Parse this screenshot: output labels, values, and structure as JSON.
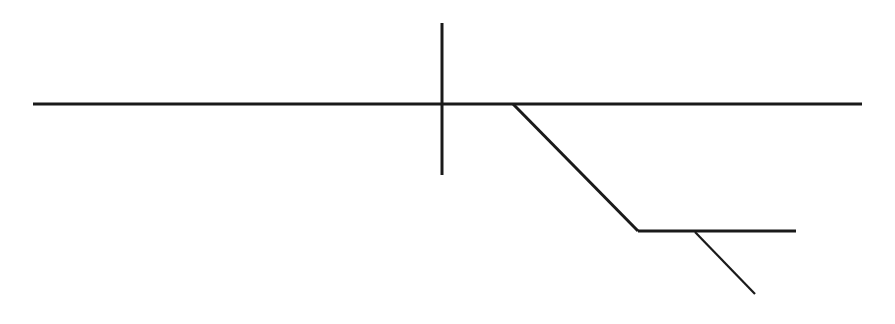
{
  "diagram": {
    "type": "line-sketch",
    "background": "#ffffff",
    "stroke_color": "#1a1a1a",
    "lines": [
      {
        "id": "main-horizontal",
        "x1": 33,
        "y1": 104,
        "x2": 862,
        "y2": 104,
        "width": 3
      },
      {
        "id": "vertical-tick",
        "x1": 442,
        "y1": 23,
        "x2": 442,
        "y2": 175,
        "width": 3
      },
      {
        "id": "branch-diagonal",
        "x1": 513,
        "y1": 104,
        "x2": 638,
        "y2": 231,
        "width": 3
      },
      {
        "id": "lower-horizontal",
        "x1": 638,
        "y1": 231,
        "x2": 796,
        "y2": 231,
        "width": 3
      },
      {
        "id": "lower-diagonal",
        "x1": 695,
        "y1": 232,
        "x2": 755,
        "y2": 294,
        "width": 2.2
      }
    ]
  }
}
